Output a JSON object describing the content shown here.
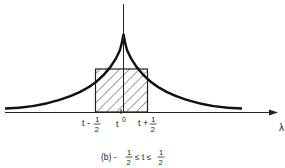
{
  "figure": {
    "caption_prefix": "(b) -",
    "caption_frac_num": "1",
    "caption_frac_den": "2",
    "caption_mid": "≤ t ≤",
    "caption_frac2_num": "1",
    "caption_frac2_den": "2"
  },
  "axis": {
    "x_label": "λ"
  },
  "ticks": {
    "left_prefix": "t -",
    "left_num": "1",
    "left_den": "2",
    "center_t": "t",
    "center_zero": "0",
    "right_prefix": "t +",
    "right_num": "1",
    "right_den": "2"
  },
  "colors": {
    "ink": "#111111",
    "background": "#ffffff"
  }
}
